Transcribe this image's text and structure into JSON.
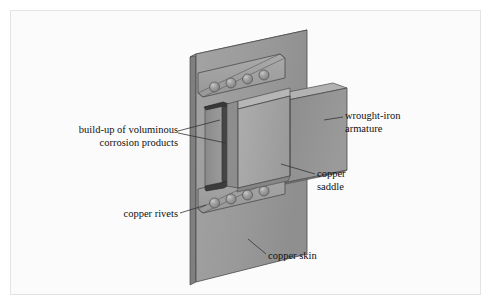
{
  "figure": {
    "background_color": "#fbfbfb",
    "frame_border_color": "#e3e3e3",
    "canvas_color": "#ffffff"
  },
  "labels": [
    {
      "id": "corrosion",
      "name": "label-corrosion-build-up",
      "line1": "build-up of voluminous",
      "line2": "corrosion products",
      "align": "right",
      "x": 13,
      "y": 124
    },
    {
      "id": "armature",
      "name": "label-wrought-iron-armature",
      "line1": "wrought-iron",
      "line2": "armature",
      "align": "left",
      "x": 345,
      "y": 110
    },
    {
      "id": "saddle",
      "name": "label-copper-saddle",
      "line1": "copper",
      "line2": "saddle",
      "align": "left",
      "x": 317,
      "y": 168
    },
    {
      "id": "rivets",
      "name": "label-copper-rivets",
      "line1": "copper rivets",
      "line2": "",
      "align": "right",
      "x": 38,
      "y": 208
    },
    {
      "id": "skin",
      "name": "label-copper-skin",
      "line1": "copper skin",
      "line2": "",
      "align": "left",
      "x": 268,
      "y": 250
    }
  ],
  "colors": {
    "copper_skin_face": "#9a9a9a",
    "copper_skin_edge_top": "#b9b9b9",
    "copper_skin_edge_left": "#8a8a8a",
    "saddle_face": "#a5a5a5",
    "saddle_side": "#8e8e8e",
    "saddle_top": "#b4b4b4",
    "armature_face": "#8f8f8f",
    "armature_top": "#b0b0b0",
    "rivet_strip": "#a0a0a0",
    "rivet_dome": "#8f8f8f",
    "rivet_highlight": "#b5b5b5",
    "corrosion_dark": "#3a3a3a",
    "outline": "#4a4a4a",
    "leader_line": "#333333",
    "text": "#111111"
  },
  "parts": {
    "copper_skin": {
      "name": "copper-skin-panel",
      "description": "large vertical sheet, back plane"
    },
    "copper_saddle": {
      "name": "copper-saddle",
      "description": "U-shaped bracket wrapping the armature"
    },
    "wrought_iron_armature": {
      "name": "wrought-iron-armature",
      "description": "horizontal bar projecting to the right"
    },
    "corrosion": {
      "name": "corrosion-build-up",
      "description": "dark voluminous deposit between saddle and armature"
    },
    "rivet_rows": [
      {
        "name": "rivet-row-upper",
        "count": 4
      },
      {
        "name": "rivet-row-lower",
        "count": 4
      }
    ]
  },
  "rivets": {
    "upper": [
      {
        "cx": 214.5,
        "cy": 87.0,
        "r": 5.0
      },
      {
        "cx": 231.0,
        "cy": 83.0,
        "r": 5.0
      },
      {
        "cx": 247.5,
        "cy": 79.0,
        "r": 5.0
      },
      {
        "cx": 264.0,
        "cy": 75.0,
        "r": 5.0
      }
    ],
    "lower": [
      {
        "cx": 214.5,
        "cy": 203.0,
        "r": 5.0
      },
      {
        "cx": 231.0,
        "cy": 199.0,
        "r": 5.0
      },
      {
        "cx": 247.5,
        "cy": 195.0,
        "r": 5.0
      },
      {
        "cx": 264.0,
        "cy": 191.0,
        "r": 5.0
      }
    ]
  }
}
